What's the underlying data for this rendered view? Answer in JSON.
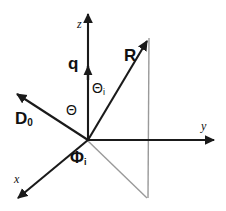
{
  "figure": {
    "kind": "3d-coordinate-geometry-diagram",
    "background_color": "#ffffff",
    "stroke_color": "#1a1a1a",
    "projection_color": "#999999"
  },
  "axes": {
    "z": {
      "label": "z",
      "origin": [
        88,
        140
      ],
      "tip": [
        88,
        10
      ]
    },
    "y": {
      "label": "y",
      "origin": [
        88,
        140
      ],
      "tip": [
        218,
        140
      ]
    },
    "x": {
      "label": "x",
      "origin": [
        88,
        140
      ],
      "tip": [
        16,
        200
      ]
    }
  },
  "vectors": {
    "q": {
      "label": "q",
      "subscript": "",
      "origin": [
        88,
        140
      ],
      "tip": [
        88,
        68
      ]
    },
    "R": {
      "label": "R",
      "subscript": "",
      "origin": [
        88,
        140
      ],
      "tip": [
        150,
        37
      ]
    },
    "D0": {
      "label": "D",
      "subscript": "0",
      "origin": [
        88,
        140
      ],
      "tip": [
        14,
        92
      ]
    }
  },
  "angles": {
    "theta": {
      "label": "Θ",
      "subscript": ""
    },
    "theta_i": {
      "label": "Θ",
      "subscript": "i"
    },
    "phi_i": {
      "label": "Φ",
      "subscript": "i"
    }
  },
  "projection": {
    "foot": [
      147,
      198
    ],
    "vertical_top": [
      149,
      38
    ]
  }
}
